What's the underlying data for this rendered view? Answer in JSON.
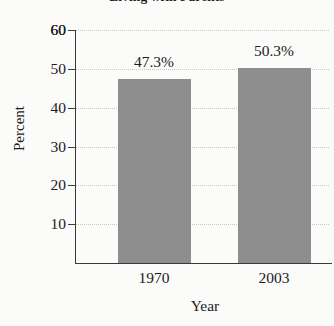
{
  "chart_data": {
    "type": "bar",
    "title": "Living with Parents",
    "xlabel": "Year",
    "ylabel": "Percent",
    "categories": [
      "1970",
      "2003"
    ],
    "values": [
      47.3,
      50.3
    ],
    "value_labels": [
      "47.3%",
      "50.3%"
    ],
    "ylim": [
      0,
      60
    ],
    "yticks": [
      10,
      20,
      30,
      40,
      50,
      60
    ],
    "ytick_labels": [
      "10",
      "20",
      "30",
      "40",
      "50",
      "60"
    ],
    "grid": true,
    "grid_axis": "y",
    "legend": null,
    "bar_color": "#8e8e8e",
    "axis_color": "#3a3a3a",
    "grid_color": "#c9c9c4",
    "background": "#fbfbfa"
  }
}
